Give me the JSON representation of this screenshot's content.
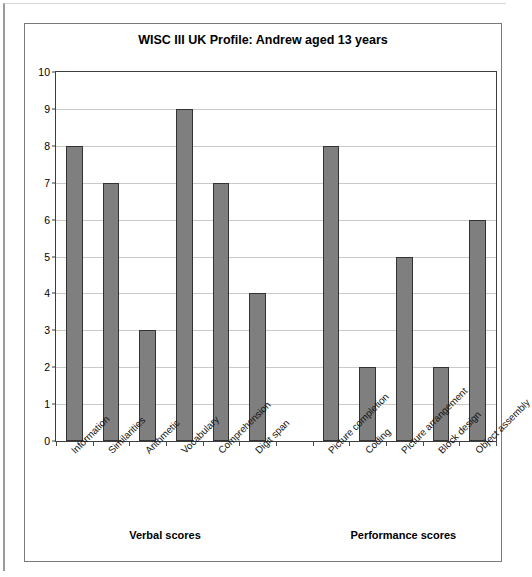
{
  "chart_data": {
    "type": "bar",
    "title": "WISC III UK Profile: Andrew aged 13 years",
    "xlabel": "",
    "ylabel": "",
    "ylim": [
      0,
      10
    ],
    "ytick_step": 1,
    "grid": true,
    "legend": false,
    "bar_color": "#7f7f7f",
    "bar_border_color": "#333333",
    "categories": [
      "Information",
      "Similarities",
      "Arithmetic",
      "Vocabulary",
      "Comprehension",
      "Digit span",
      "",
      "Picture completion",
      "Coding",
      "Picture arrangement",
      "Block design",
      "Object assembly"
    ],
    "values": [
      8,
      7,
      3,
      9,
      7,
      4,
      null,
      8,
      2,
      5,
      2,
      6
    ],
    "ytick_labels": [
      "0",
      "1",
      "2",
      "3",
      "4",
      "5",
      "6",
      "7",
      "8",
      "9",
      "10"
    ],
    "groups": [
      {
        "label": "Verbal scores",
        "first_index": 0,
        "last_index": 5
      },
      {
        "label": "Performance scores",
        "first_index": 7,
        "last_index": 11
      }
    ]
  }
}
